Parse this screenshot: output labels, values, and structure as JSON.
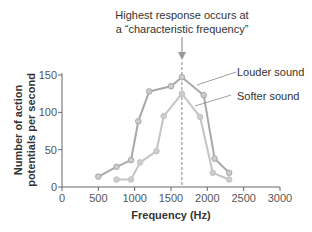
{
  "chart_data": {
    "type": "line",
    "title": "",
    "annotation": [
      "Highest response occurs at",
      "a “characteristic frequency”"
    ],
    "xlabel": "Frequency (Hz)",
    "ylabel": [
      "Number of action",
      "potentials per second"
    ],
    "xlim": [
      0,
      3000
    ],
    "ylim": [
      0,
      150
    ],
    "xticks": [
      0,
      500,
      1000,
      1500,
      2000,
      2500,
      3000
    ],
    "yticks": [
      0,
      50,
      100,
      150
    ],
    "characteristic_frequency": 1650,
    "series": [
      {
        "name": "Louder sound",
        "color": "#a8a8a8",
        "x": [
          500,
          750,
          950,
          1050,
          1200,
          1500,
          1650,
          1950,
          2100,
          2300
        ],
        "y": [
          14,
          27,
          36,
          88,
          128,
          135,
          147,
          123,
          38,
          19
        ]
      },
      {
        "name": "Softer sound",
        "color": "#c4c4c4",
        "x": [
          750,
          950,
          1075,
          1300,
          1400,
          1650,
          1900,
          2075,
          2300
        ],
        "y": [
          10,
          10,
          33,
          48,
          95,
          125,
          94,
          19,
          10
        ]
      }
    ]
  }
}
